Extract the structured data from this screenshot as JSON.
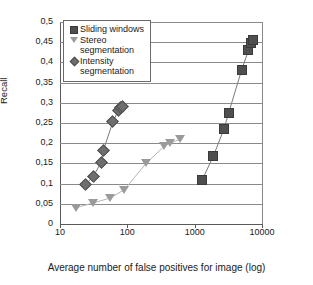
{
  "chart_data": {
    "type": "scatter",
    "title": "",
    "xlabel": "Average number of false positives for image (log)",
    "ylabel": "Recall",
    "xscale": "log",
    "xlim": [
      10,
      10000
    ],
    "ylim": [
      0,
      0.5
    ],
    "xticks": [
      "10",
      "100",
      "1000",
      "10000"
    ],
    "xtick_values": [
      10,
      100,
      1000,
      10000
    ],
    "yticks": [
      "0",
      "0,05",
      "0,1",
      "0,15",
      "0,2",
      "0,25",
      "0,3",
      "0,35",
      "0,4",
      "0,45",
      "0,5"
    ],
    "ytick_values": [
      0,
      0.05,
      0.1,
      0.15,
      0.2,
      0.25,
      0.3,
      0.35,
      0.4,
      0.45,
      0.5
    ],
    "grid": "horizontal",
    "legend_position": "top-left",
    "decimal_separator": ",",
    "series": [
      {
        "name": "Sliding windows",
        "marker": "square",
        "color": "#4f4f4f",
        "points": [
          {
            "x": 1300,
            "y": 0.11
          },
          {
            "x": 1900,
            "y": 0.168
          },
          {
            "x": 2700,
            "y": 0.234
          },
          {
            "x": 3200,
            "y": 0.275
          },
          {
            "x": 5000,
            "y": 0.382
          },
          {
            "x": 6300,
            "y": 0.43
          },
          {
            "x": 6800,
            "y": 0.447
          },
          {
            "x": 7400,
            "y": 0.456
          }
        ]
      },
      {
        "name": "Stereo segmentation",
        "marker": "triangle",
        "color": "#9a9a9a",
        "points": [
          {
            "x": 17,
            "y": 0.04
          },
          {
            "x": 31,
            "y": 0.052
          },
          {
            "x": 55,
            "y": 0.064
          },
          {
            "x": 90,
            "y": 0.085
          },
          {
            "x": 190,
            "y": 0.15
          },
          {
            "x": 350,
            "y": 0.192
          },
          {
            "x": 430,
            "y": 0.2
          },
          {
            "x": 600,
            "y": 0.21
          }
        ]
      },
      {
        "name": "Intensity segmentation",
        "marker": "diamond",
        "color": "#6e6e6e",
        "points": [
          {
            "x": 24,
            "y": 0.098
          },
          {
            "x": 31,
            "y": 0.117
          },
          {
            "x": 41,
            "y": 0.153
          },
          {
            "x": 44,
            "y": 0.182
          },
          {
            "x": 61,
            "y": 0.253
          },
          {
            "x": 74,
            "y": 0.282
          },
          {
            "x": 80,
            "y": 0.289
          },
          {
            "x": 85,
            "y": 0.291
          }
        ]
      }
    ]
  },
  "legend": {
    "items": [
      {
        "label": "Sliding windows",
        "marker": "square"
      },
      {
        "label": "Stereo segmentation",
        "marker": "triangle"
      },
      {
        "label": "Intensity segmentation",
        "marker": "diamond"
      }
    ]
  }
}
